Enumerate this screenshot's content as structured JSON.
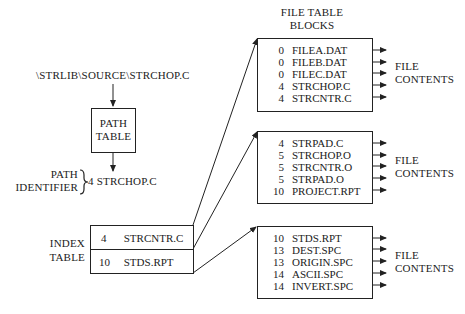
{
  "path_input": "\\STRLIB\\SOURCE\\STRCHOP.C",
  "path_table": {
    "line1": "PATH",
    "line2": "TABLE"
  },
  "path_identifier": {
    "label1": "PATH",
    "label2": "IDENTIFIER",
    "value": "4 STRCHOP.C"
  },
  "index_table": {
    "label1": "INDEX",
    "label2": "TABLE",
    "rows": [
      {
        "num": "4",
        "name": "STRCNTR.C"
      },
      {
        "num": "10",
        "name": "STDS.RPT"
      }
    ]
  },
  "file_table": {
    "title1": "FILE TABLE",
    "title2": "BLOCKS"
  },
  "blocks": [
    {
      "rows": [
        {
          "num": "0",
          "name": "FILEA.DAT"
        },
        {
          "num": "0",
          "name": "FILEB.DAT"
        },
        {
          "num": "0",
          "name": "FILEC.DAT"
        },
        {
          "num": "4",
          "name": "STRCHOP.C"
        },
        {
          "num": "4",
          "name": "STRCNTR.C"
        }
      ],
      "contents1": "FILE",
      "contents2": "CONTENTS"
    },
    {
      "rows": [
        {
          "num": "4",
          "name": "STRPAD.C"
        },
        {
          "num": "5",
          "name": "STRCHOP.O"
        },
        {
          "num": "5",
          "name": "STRCNTR.O"
        },
        {
          "num": "5",
          "name": "STRPAD.O"
        },
        {
          "num": "10",
          "name": "PROJECT.RPT"
        }
      ],
      "contents1": "FILE",
      "contents2": "CONTENTS"
    },
    {
      "rows": [
        {
          "num": "10",
          "name": "STDS.RPT"
        },
        {
          "num": "13",
          "name": "DEST.SPC"
        },
        {
          "num": "13",
          "name": "ORIGIN.SPC"
        },
        {
          "num": "14",
          "name": "ASCII.SPC"
        },
        {
          "num": "14",
          "name": "INVERT.SPC"
        }
      ],
      "contents1": "FILE",
      "contents2": "CONTENTS"
    }
  ]
}
